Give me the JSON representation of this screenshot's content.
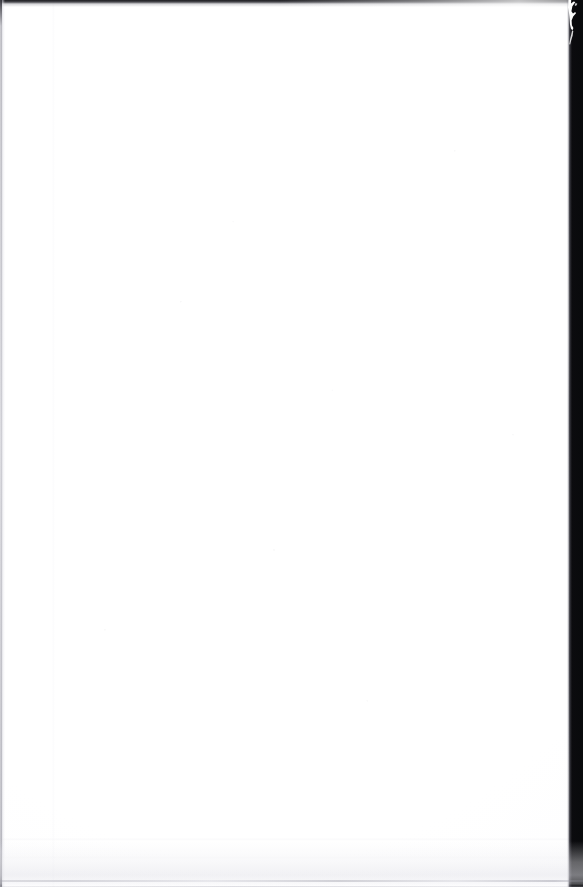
{
  "document": {
    "page_kind": "blank-scanned-page",
    "visible_text": "",
    "body_text": "",
    "page_number": "",
    "header_text": "",
    "footer_text": "",
    "caption": ""
  },
  "scan": {
    "width_px": 583,
    "height_px": 887,
    "paper_color": "#ffffff",
    "paper_tint": "#fbfbfc",
    "margin_color": "#090a0c",
    "edge_line_color": "#b0b0ba",
    "bottom_shadow_color": "#e4e4ea"
  },
  "artifacts": {
    "top_band": "dark-scanner-band",
    "left_edge": "page-edge-hairline",
    "right_margin": "dark-platen-margin",
    "right_margin_mark": "white-hook-tear-artifact",
    "bottom_edge": "page-lift-shadow",
    "speckle": "dust-specks"
  }
}
